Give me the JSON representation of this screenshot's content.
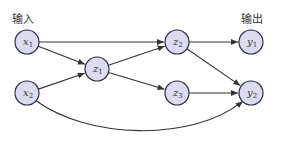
{
  "labels": {
    "input": "输入",
    "output": "输出"
  },
  "colors": {
    "node_fill": "#dcdcf0",
    "node_stroke": "#2e2e4a",
    "edge": "#333333"
  },
  "nodes": [
    {
      "id": "x1",
      "base": "x",
      "sub": "1",
      "cx": 27,
      "cy": 42
    },
    {
      "id": "x2",
      "base": "x",
      "sub": "2",
      "cx": 27,
      "cy": 93
    },
    {
      "id": "z1",
      "base": "z",
      "sub": "1",
      "cx": 97,
      "cy": 69
    },
    {
      "id": "z2",
      "base": "z",
      "sub": "2",
      "cx": 177,
      "cy": 42
    },
    {
      "id": "z3",
      "base": "z",
      "sub": "3",
      "cx": 177,
      "cy": 93
    },
    {
      "id": "y1",
      "base": "y",
      "sub": "1",
      "cx": 251,
      "cy": 42
    },
    {
      "id": "y2",
      "base": "y",
      "sub": "2",
      "cx": 251,
      "cy": 93
    }
  ],
  "edges": [
    {
      "from": "x1",
      "to": "z2"
    },
    {
      "from": "x1",
      "to": "z1"
    },
    {
      "from": "x2",
      "to": "z1"
    },
    {
      "from": "x2",
      "to": "y2",
      "curved": true
    },
    {
      "from": "z1",
      "to": "z2"
    },
    {
      "from": "z1",
      "to": "z3"
    },
    {
      "from": "z2",
      "to": "y1"
    },
    {
      "from": "z2",
      "to": "y2"
    },
    {
      "from": "z3",
      "to": "y2"
    }
  ]
}
